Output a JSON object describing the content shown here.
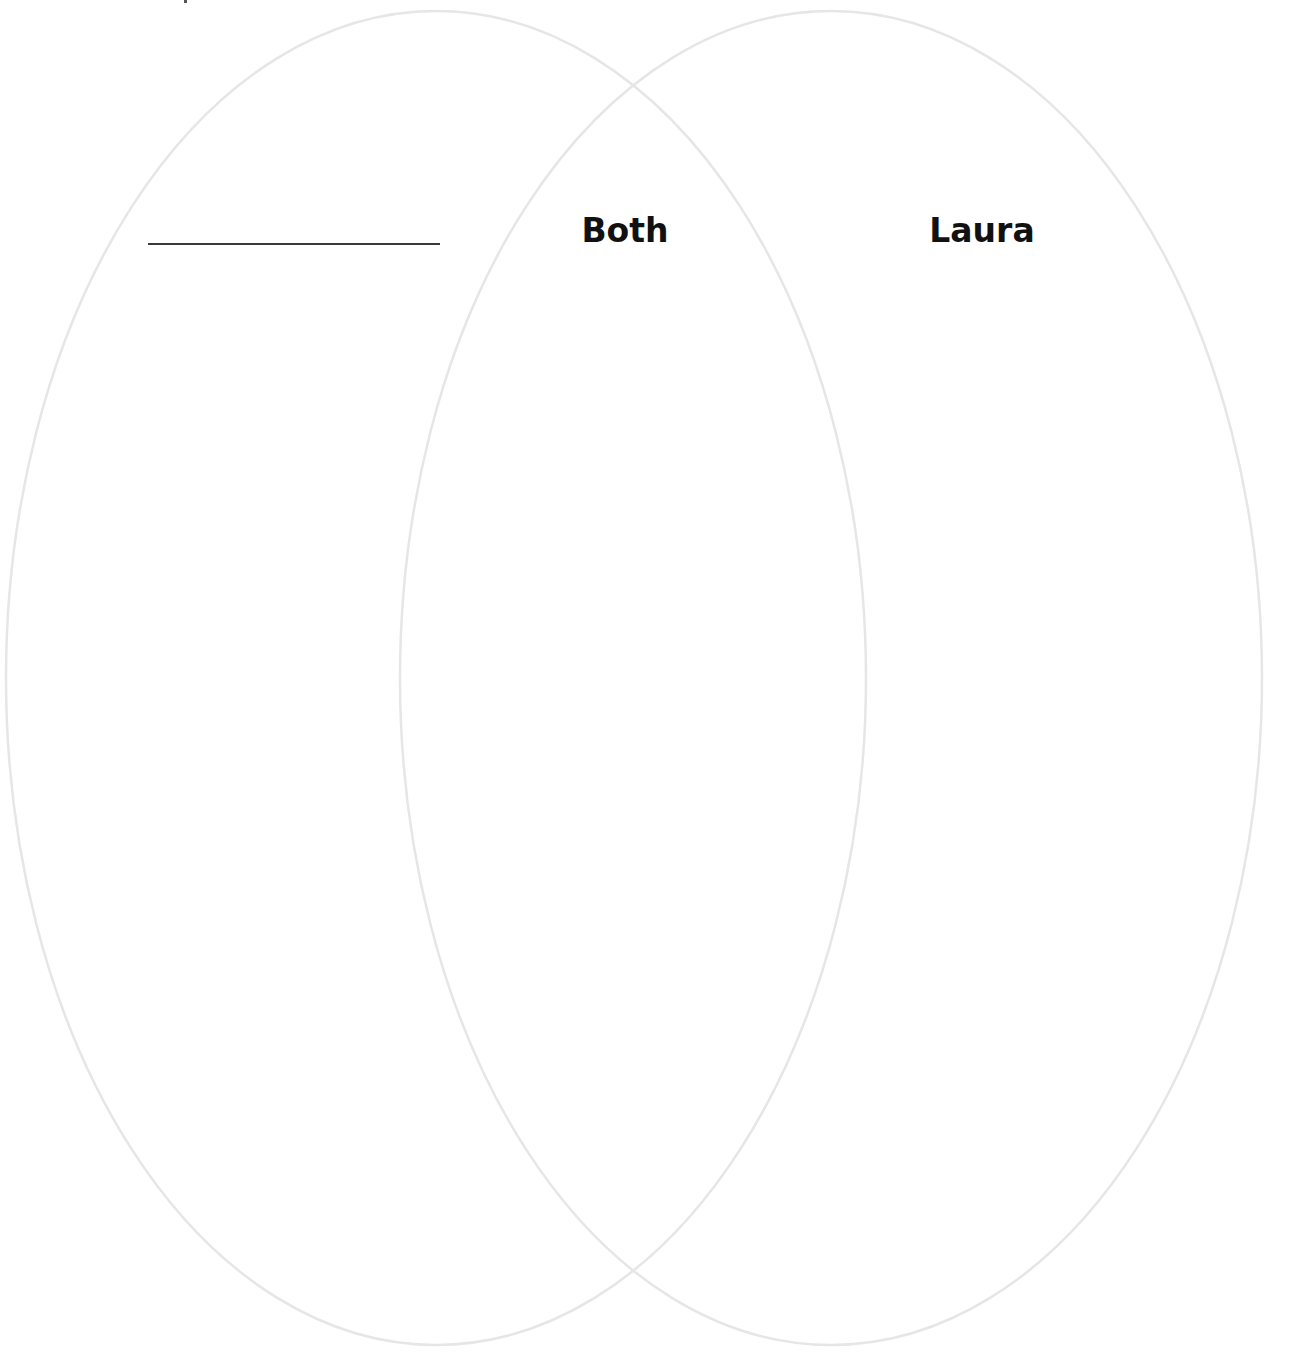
{
  "diagram": {
    "type": "venn",
    "stroke_color": "#e6e6e6",
    "label_color": "#111111",
    "sets": [
      {
        "id": "left",
        "label": "",
        "label_style": "blank-write-in-line",
        "ellipse": {
          "cx": 436,
          "cy": 678,
          "rx": 430,
          "ry": 667
        }
      },
      {
        "id": "right",
        "label": "Laura",
        "ellipse": {
          "cx": 831,
          "cy": 678,
          "rx": 431,
          "ry": 667
        }
      }
    ],
    "intersection": {
      "label": "Both"
    }
  }
}
